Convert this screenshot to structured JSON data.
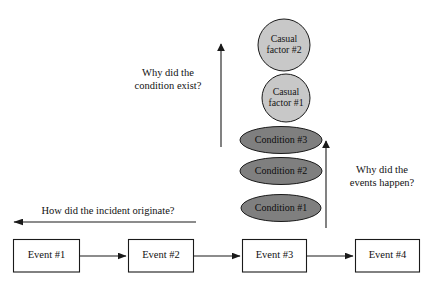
{
  "diagram": {
    "colors": {
      "background": "#ffffff",
      "stroke": "#1a1a1a",
      "condition_fill": "#7f7f7f",
      "factor_fill": "#c8c8c8",
      "event_fill": "#ffffff",
      "text": "#111111"
    },
    "events": [
      {
        "id": "event-1",
        "label": "Event #1"
      },
      {
        "id": "event-2",
        "label": "Event #2"
      },
      {
        "id": "event-3",
        "label": "Event #3"
      },
      {
        "id": "event-4",
        "label": "Event #4"
      }
    ],
    "conditions": [
      {
        "id": "condition-1",
        "label": "Condition #1"
      },
      {
        "id": "condition-2",
        "label": "Condition #2"
      },
      {
        "id": "condition-3",
        "label": "Condition #3"
      }
    ],
    "causal_factors": [
      {
        "id": "casual-factor-1",
        "label": "Casual\nfactor #1"
      },
      {
        "id": "casual-factor-2",
        "label": "Casual\nfactor #2"
      }
    ],
    "annotations": [
      {
        "id": "why-condition-exist",
        "label": "Why did the\ncondition exist?"
      },
      {
        "id": "why-events-happen",
        "label": "Why did the\nevents happen?"
      },
      {
        "id": "how-incident-originate",
        "label": "How did the incident originate?"
      }
    ]
  }
}
